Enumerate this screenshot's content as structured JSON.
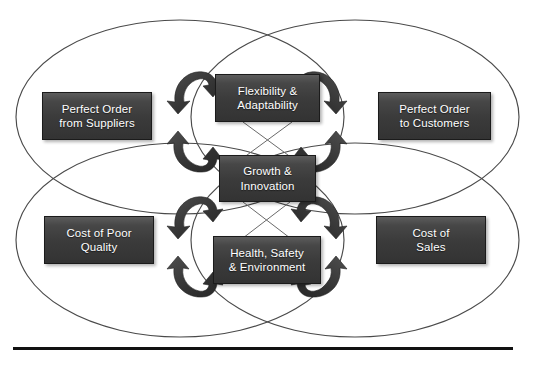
{
  "diagram": {
    "background_color": "#ffffff",
    "ellipse_stroke_color": "#4a4a4a",
    "box_fill_color": "#3b3b3b",
    "box_border_color": "#1b1b1b",
    "box_text_color": "#ffffff",
    "arrow_color": "#3a3a3a",
    "rule_color": "#111111",
    "nodes": [
      {
        "id": "perfect-order-from-suppliers",
        "label": "Perfect Order\nfrom Suppliers",
        "x": 42,
        "y": 92,
        "w": 110,
        "h": 48
      },
      {
        "id": "flexibility-adaptability",
        "label": "Flexibility &\nAdaptability",
        "x": 215,
        "y": 74,
        "w": 105,
        "h": 48
      },
      {
        "id": "perfect-order-to-customers",
        "label": "Perfect Order\nto Customers",
        "x": 378,
        "y": 92,
        "w": 113,
        "h": 48
      },
      {
        "id": "growth-innovation",
        "label": "Growth &\nInnovation",
        "x": 219,
        "y": 155,
        "w": 97,
        "h": 47
      },
      {
        "id": "cost-of-poor-quality",
        "label": "Cost of Poor\nQuality",
        "x": 44,
        "y": 216,
        "w": 110,
        "h": 48
      },
      {
        "id": "health-safety-environment",
        "label": "Health, Safety\n& Environment",
        "x": 213,
        "y": 236,
        "w": 108,
        "h": 48
      },
      {
        "id": "cost-of-sales",
        "label": "Cost of\nSales",
        "x": 376,
        "y": 216,
        "w": 110,
        "h": 48
      }
    ],
    "ellipses": [
      {
        "id": "ellipse-top-left",
        "cx": 180,
        "cy": 117,
        "rx": 164,
        "ry": 97
      },
      {
        "id": "ellipse-top-right",
        "cx": 355,
        "cy": 117,
        "rx": 164,
        "ry": 97
      },
      {
        "id": "ellipse-bottom-left",
        "cx": 180,
        "cy": 240,
        "rx": 164,
        "ry": 97
      },
      {
        "id": "ellipse-bottom-right",
        "cx": 355,
        "cy": 240,
        "rx": 164,
        "ry": 97
      }
    ],
    "arrows": [
      {
        "id": "arrow-top-left-upper",
        "group": "top-left",
        "direction": "counterclockwise-top"
      },
      {
        "id": "arrow-top-left-lower",
        "group": "top-left",
        "direction": "counterclockwise-bottom"
      },
      {
        "id": "arrow-top-right-upper",
        "group": "top-right",
        "direction": "clockwise-top"
      },
      {
        "id": "arrow-top-right-lower",
        "group": "top-right",
        "direction": "clockwise-bottom"
      },
      {
        "id": "arrow-bottom-left-upper",
        "group": "bottom-left",
        "direction": "counterclockwise-top"
      },
      {
        "id": "arrow-bottom-left-lower",
        "group": "bottom-left",
        "direction": "counterclockwise-bottom"
      },
      {
        "id": "arrow-bottom-right-upper",
        "group": "bottom-right",
        "direction": "clockwise-top"
      },
      {
        "id": "arrow-bottom-right-lower",
        "group": "bottom-right",
        "direction": "clockwise-bottom"
      }
    ],
    "connector_lines": [
      {
        "id": "connector-flex-to-growth-left"
      },
      {
        "id": "connector-flex-to-growth-right"
      },
      {
        "id": "connector-growth-to-hse-left"
      },
      {
        "id": "connector-growth-to-hse-right"
      }
    ],
    "bottom_rule": {
      "x": 13,
      "y": 347,
      "w": 500,
      "h": 3
    }
  }
}
